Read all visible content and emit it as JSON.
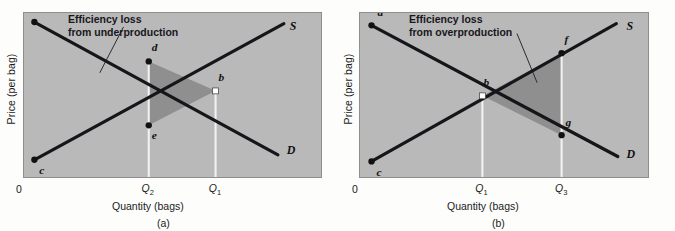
{
  "figure": {
    "type": "economics-supply-demand-diagram",
    "colors": {
      "plot_background": "#b9b9b9",
      "plot_border": "#8e8e8e",
      "shaded_loss_region": "#8f8f8f",
      "curve_line": "#15151a",
      "dropline": "#f2f2f2",
      "text": "#1b1b1b"
    }
  },
  "chart_data": {
    "type": "line",
    "panels": [
      {
        "id": "a",
        "caption": "(a)",
        "callout": {
          "line1": "Efficiency loss",
          "line2": "from underproduction"
        },
        "xlabel": "Quantity (bags)",
        "ylabel": "Price (per bag)",
        "origin_label": "0",
        "xticks": [
          {
            "label": "Q",
            "sub": "2",
            "x": 0.42
          },
          {
            "label": "Q",
            "sub": "1",
            "x": 0.645
          }
        ],
        "series": [
          {
            "name": "Demand",
            "label": "D",
            "label_point": {
              "x": 0.885,
              "y": 0.155
            },
            "points": [
              {
                "x": 0.035,
                "y": 0.945
              },
              {
                "x": 0.855,
                "y": 0.135
              }
            ]
          },
          {
            "name": "Supply",
            "label": "S",
            "label_point": {
              "x": 0.895,
              "y": 0.915
            },
            "points": [
              {
                "x": 0.035,
                "y": 0.105
              },
              {
                "x": 0.875,
                "y": 0.935
              }
            ]
          }
        ],
        "marked_points": [
          {
            "label": "a",
            "x": 0.035,
            "y": 0.945,
            "marker": "filled",
            "label_dx": 6,
            "label_dy": -12
          },
          {
            "label": "d",
            "x": 0.42,
            "y": 0.705,
            "marker": "filled",
            "label_dx": 3,
            "label_dy": -13
          },
          {
            "label": "b",
            "x": 0.645,
            "y": 0.525,
            "marker": "hollow",
            "label_dx": 3,
            "label_dy": -13
          },
          {
            "label": "e",
            "x": 0.42,
            "y": 0.315,
            "marker": "filled",
            "label_dx": 3,
            "label_dy": 11
          },
          {
            "label": "c",
            "x": 0.035,
            "y": 0.105,
            "marker": "filled",
            "label_dx": 5,
            "label_dy": 12
          }
        ],
        "shaded_region": {
          "name": "deadweight-loss-underproduction",
          "vertices": [
            "d",
            "b",
            "e"
          ]
        },
        "droplines": [
          {
            "at": "Q2",
            "x": 0.42,
            "from_y": 0.705,
            "to_y": 0.0
          },
          {
            "at": "Q1",
            "x": 0.645,
            "from_y": 0.525,
            "to_y": 0.0
          }
        ],
        "leader_line": {
          "x1": 0.335,
          "y1": 0.915,
          "x2": 0.255,
          "y2": 0.635
        }
      },
      {
        "id": "b",
        "caption": "(b)",
        "callout": {
          "line1": "Efficiency loss",
          "line2": "from overproduction"
        },
        "xlabel": "Quantity (bags)",
        "ylabel": "Price (per bag)",
        "origin_label": "0",
        "xticks": [
          {
            "label": "Q",
            "sub": "1",
            "x": 0.425
          },
          {
            "label": "Q",
            "sub": "3",
            "x": 0.7
          }
        ],
        "series": [
          {
            "name": "Demand",
            "label": "D",
            "label_point": {
              "x": 0.925,
              "y": 0.135
            },
            "points": [
              {
                "x": 0.04,
                "y": 0.925
              },
              {
                "x": 0.895,
                "y": 0.125
              }
            ]
          },
          {
            "name": "Supply",
            "label": "S",
            "label_point": {
              "x": 0.925,
              "y": 0.915
            },
            "points": [
              {
                "x": 0.04,
                "y": 0.095
              },
              {
                "x": 0.89,
                "y": 0.935
              }
            ]
          }
        ],
        "marked_points": [
          {
            "label": "a",
            "x": 0.04,
            "y": 0.925,
            "marker": "filled",
            "label_dx": 6,
            "label_dy": -12
          },
          {
            "label": "b",
            "x": 0.425,
            "y": 0.495,
            "marker": "hollow",
            "label_dx": 1,
            "label_dy": -13
          },
          {
            "label": "f",
            "x": 0.7,
            "y": 0.755,
            "marker": "filled",
            "label_dx": 3,
            "label_dy": -13
          },
          {
            "label": "g",
            "x": 0.7,
            "y": 0.255,
            "marker": "filled",
            "label_dx": 4,
            "label_dy": -12
          },
          {
            "label": "c",
            "x": 0.04,
            "y": 0.095,
            "marker": "filled",
            "label_dx": 5,
            "label_dy": 12
          }
        ],
        "shaded_region": {
          "name": "deadweight-loss-overproduction",
          "vertices": [
            "b",
            "f",
            "g"
          ]
        },
        "droplines": [
          {
            "at": "Q1",
            "x": 0.425,
            "from_y": 0.495,
            "to_y": 0.0
          },
          {
            "at": "Q3",
            "x": 0.7,
            "from_y": 0.755,
            "to_y": 0.0
          }
        ],
        "leader_line": {
          "x1": 0.545,
          "y1": 0.875,
          "x2": 0.615,
          "y2": 0.575
        }
      }
    ]
  }
}
